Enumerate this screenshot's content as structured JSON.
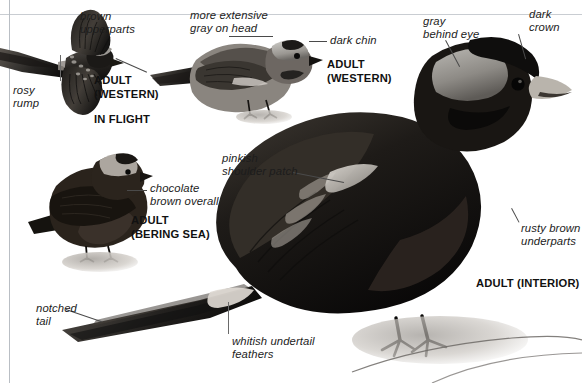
{
  "page": {
    "background": "#ffffff",
    "rule_color": "#c9cdd2"
  },
  "figures": [
    {
      "id": "in-flight-western",
      "name": "adult-western-in-flight",
      "bold_label": "ADULT\n(WESTERN)",
      "bold_label2": "IN FLIGHT"
    },
    {
      "id": "standing-western",
      "name": "adult-western-standing",
      "bold_label": "ADULT\n(WESTERN)"
    },
    {
      "id": "bering-sea",
      "name": "adult-bering-sea",
      "bold_label": "ADULT\n(BERING SEA)"
    },
    {
      "id": "interior",
      "name": "adult-interior",
      "bold_label": "ADULT (INTERIOR)"
    }
  ],
  "callouts": [
    {
      "key": "brown_upperparts",
      "text": "brown\nupperparts",
      "align": "left"
    },
    {
      "key": "rosy_rump",
      "text": "rosy\nrump",
      "align": "left"
    },
    {
      "key": "more_extensive_gray",
      "text": "more extensive\ngray on head",
      "align": "left"
    },
    {
      "key": "dark_chin",
      "text": "dark chin",
      "align": "left"
    },
    {
      "key": "gray_behind_eye",
      "text": "gray\nbehind eye",
      "align": "left"
    },
    {
      "key": "dark_crown",
      "text": "dark\ncrown",
      "align": "left"
    },
    {
      "key": "chocolate_brown",
      "text": "chocolate\nbrown overall",
      "align": "left"
    },
    {
      "key": "pinkish_shoulder",
      "text": "pinkish\nshoulder patch",
      "align": "left"
    },
    {
      "key": "rusty_brown",
      "text": "rusty brown\nunderparts",
      "align": "left"
    },
    {
      "key": "notched_tail",
      "text": "notched\ntail",
      "align": "left"
    },
    {
      "key": "whitish_undertail",
      "text": "whitish undertail\nfeathers",
      "align": "left"
    }
  ],
  "bold_labels": {
    "in_flight_adult": "ADULT\n(WESTERN)",
    "in_flight": "IN FLIGHT",
    "standing_adult": "ADULT\n(WESTERN)",
    "bering_adult": "ADULT\n(BERING SEA)",
    "interior_adult": "ADULT (INTERIOR)"
  }
}
